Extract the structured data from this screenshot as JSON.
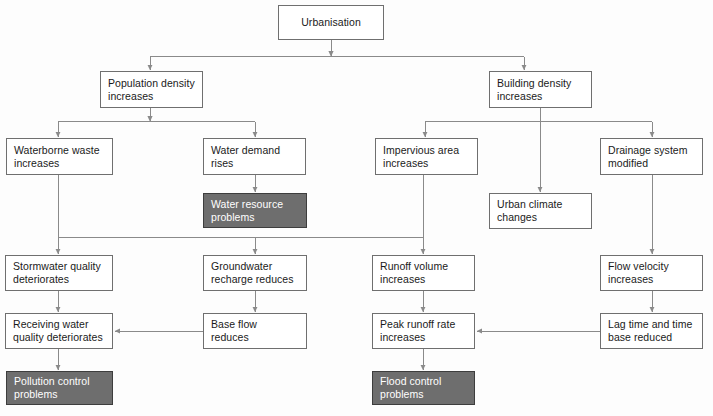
{
  "diagram": {
    "colors": {
      "box_fill": "#ffffff",
      "box_stroke": "#6f6f6f",
      "shaded_fill": "#6e6e6e",
      "shaded_stroke": "#3d3d3d",
      "shaded_text": "#ffffff",
      "text": "#1a1a1a",
      "edge": "#8a8a8a",
      "background": "#fdfdfd"
    },
    "nodes": [
      {
        "id": "urbanisation",
        "label": "Urbanisation",
        "x": 278,
        "y": 5,
        "w": 106,
        "h": 35,
        "shaded": false,
        "align": "center"
      },
      {
        "id": "population-density",
        "label": "Population density\nincreases",
        "x": 100,
        "y": 71,
        "w": 103,
        "h": 37,
        "shaded": false,
        "align": "left"
      },
      {
        "id": "building-density",
        "label": "Building density\nincreases",
        "x": 489,
        "y": 71,
        "w": 103,
        "h": 37,
        "shaded": false,
        "align": "left"
      },
      {
        "id": "waterborne-waste",
        "label": "Waterborne waste\nincreases",
        "x": 6,
        "y": 138,
        "w": 107,
        "h": 37,
        "shaded": false,
        "align": "left"
      },
      {
        "id": "water-demand",
        "label": "Water demand\nrises",
        "x": 203,
        "y": 138,
        "w": 103,
        "h": 37,
        "shaded": false,
        "align": "left"
      },
      {
        "id": "impervious-area",
        "label": "Impervious area\nincreases",
        "x": 375,
        "y": 138,
        "w": 103,
        "h": 37,
        "shaded": false,
        "align": "left"
      },
      {
        "id": "drainage-system",
        "label": "Drainage system\nmodified",
        "x": 600,
        "y": 138,
        "w": 103,
        "h": 37,
        "shaded": false,
        "align": "left"
      },
      {
        "id": "water-resource",
        "label": "Water resource\nproblems",
        "x": 203,
        "y": 193,
        "w": 104,
        "h": 35,
        "shaded": true,
        "align": "left"
      },
      {
        "id": "urban-climate",
        "label": "Urban climate\nchanges",
        "x": 489,
        "y": 193,
        "w": 103,
        "h": 36,
        "shaded": false,
        "align": "left"
      },
      {
        "id": "stormwater-quality",
        "label": "Stormwater quality\ndeteriorates",
        "x": 5,
        "y": 255,
        "w": 108,
        "h": 36,
        "shaded": false,
        "align": "left"
      },
      {
        "id": "groundwater-recharge",
        "label": "Groundwater\nrecharge reduces",
        "x": 203,
        "y": 255,
        "w": 104,
        "h": 36,
        "shaded": false,
        "align": "left"
      },
      {
        "id": "runoff-volume",
        "label": "Runoff volume\nincreases",
        "x": 372,
        "y": 255,
        "w": 103,
        "h": 36,
        "shaded": false,
        "align": "left"
      },
      {
        "id": "flow-velocity",
        "label": "Flow velocity\nincreases",
        "x": 600,
        "y": 255,
        "w": 103,
        "h": 36,
        "shaded": false,
        "align": "left"
      },
      {
        "id": "receiving-water",
        "label": "Receiving water\nquality deteriorates",
        "x": 5,
        "y": 313,
        "w": 108,
        "h": 36,
        "shaded": false,
        "align": "left"
      },
      {
        "id": "base-flow",
        "label": "Base flow\nreduces",
        "x": 203,
        "y": 313,
        "w": 104,
        "h": 36,
        "shaded": false,
        "align": "left"
      },
      {
        "id": "peak-runoff",
        "label": "Peak runoff rate\nincreases",
        "x": 372,
        "y": 313,
        "w": 103,
        "h": 36,
        "shaded": false,
        "align": "left"
      },
      {
        "id": "lag-time",
        "label": "Lag time and time\nbase reduced",
        "x": 600,
        "y": 313,
        "w": 103,
        "h": 36,
        "shaded": false,
        "align": "left"
      },
      {
        "id": "pollution-control",
        "label": "Pollution control\nproblems",
        "x": 6,
        "y": 371,
        "w": 107,
        "h": 34,
        "shaded": true,
        "align": "left"
      },
      {
        "id": "flood-control",
        "label": "Flood control\nproblems",
        "x": 372,
        "y": 371,
        "w": 103,
        "h": 34,
        "shaded": true,
        "align": "left"
      }
    ],
    "edges": [
      {
        "from": "urbanisation",
        "to": "population-density",
        "kind": "split"
      },
      {
        "from": "urbanisation",
        "to": "building-density",
        "kind": "split"
      },
      {
        "from": "population-density",
        "to": "waterborne-waste",
        "kind": "split"
      },
      {
        "from": "population-density",
        "to": "water-demand",
        "kind": "split"
      },
      {
        "from": "building-density",
        "to": "impervious-area",
        "kind": "split"
      },
      {
        "from": "building-density",
        "to": "urban-climate",
        "kind": "straight"
      },
      {
        "from": "building-density",
        "to": "drainage-system",
        "kind": "split"
      },
      {
        "from": "water-demand",
        "to": "water-resource",
        "kind": "straight"
      },
      {
        "from": "waterborne-waste",
        "to": "stormwater-quality",
        "kind": "split"
      },
      {
        "from": "waterborne-waste",
        "to": "groundwater-recharge",
        "kind": "split"
      },
      {
        "from": "waterborne-waste",
        "to": "runoff-volume",
        "kind": "split"
      },
      {
        "from": "impervious-area",
        "to": "runoff-volume",
        "kind": "straight"
      },
      {
        "from": "drainage-system",
        "to": "flow-velocity",
        "kind": "straight"
      },
      {
        "from": "stormwater-quality",
        "to": "receiving-water",
        "kind": "straight"
      },
      {
        "from": "groundwater-recharge",
        "to": "base-flow",
        "kind": "straight"
      },
      {
        "from": "runoff-volume",
        "to": "peak-runoff",
        "kind": "straight"
      },
      {
        "from": "flow-velocity",
        "to": "lag-time",
        "kind": "straight"
      },
      {
        "from": "base-flow",
        "to": "receiving-water",
        "kind": "horizontal"
      },
      {
        "from": "lag-time",
        "to": "peak-runoff",
        "kind": "horizontal"
      },
      {
        "from": "receiving-water",
        "to": "pollution-control",
        "kind": "straight"
      },
      {
        "from": "peak-runoff",
        "to": "flood-control",
        "kind": "straight"
      }
    ]
  }
}
